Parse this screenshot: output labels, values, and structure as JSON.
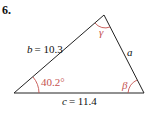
{
  "problem": {
    "number": "6."
  },
  "triangle": {
    "side_b": {
      "var": "b",
      "value": "= 10.3"
    },
    "side_a": {
      "var": "a"
    },
    "side_c": {
      "var": "c",
      "value": "= 11.4"
    },
    "angle_alpha": "40.2°",
    "angle_beta": "β",
    "angle_gamma": "γ"
  },
  "colors": {
    "line": "#222222",
    "angle": "#c5524f"
  }
}
